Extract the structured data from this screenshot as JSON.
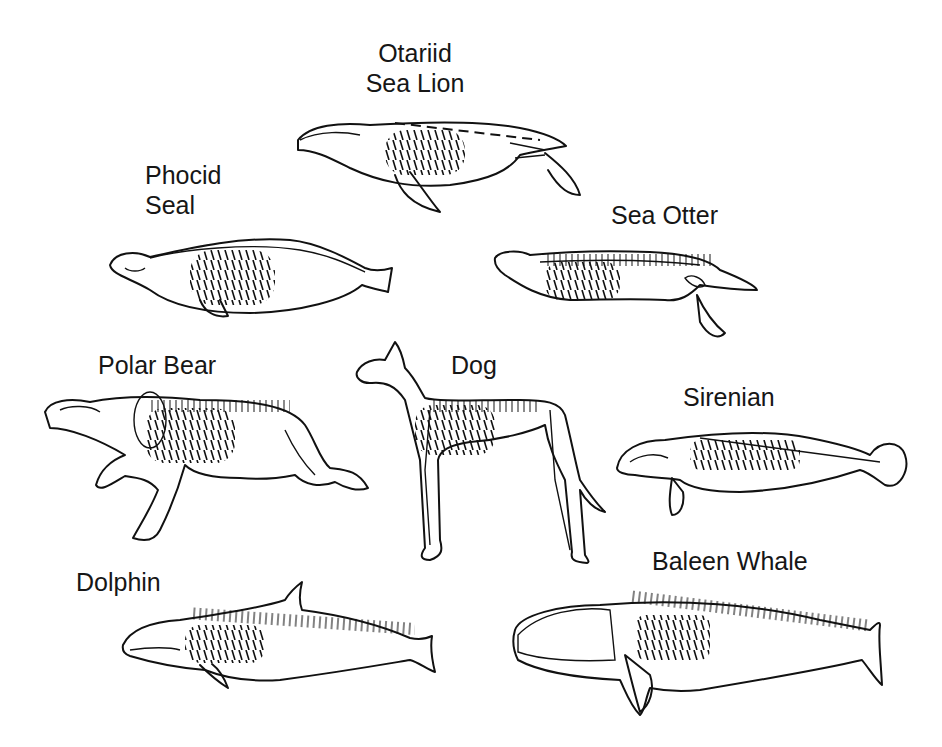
{
  "figure": {
    "background": "#ffffff",
    "line_color": "#111111"
  },
  "animals": [
    {
      "id": "otariid",
      "label_line1": "Otariid",
      "label_line2": "Sea Lion"
    },
    {
      "id": "phocid",
      "label_line1": "Phocid",
      "label_line2": "Seal"
    },
    {
      "id": "sea-otter",
      "label": "Sea Otter"
    },
    {
      "id": "polar-bear",
      "label": "Polar Bear"
    },
    {
      "id": "dog",
      "label": "Dog"
    },
    {
      "id": "sirenian",
      "label": "Sirenian"
    },
    {
      "id": "dolphin",
      "label": "Dolphin"
    },
    {
      "id": "baleen-whale",
      "label": "Baleen Whale"
    }
  ]
}
